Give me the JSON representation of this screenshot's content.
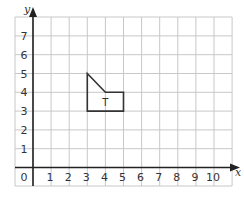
{
  "chart_data": {
    "type": "scatter",
    "title": "",
    "xlabel": "x",
    "ylabel": "y",
    "xlim": [
      0,
      10
    ],
    "ylim": [
      0,
      7
    ],
    "x_ticks": [
      "0",
      "1",
      "2",
      "3",
      "4",
      "5",
      "6",
      "7",
      "8",
      "9",
      "10"
    ],
    "y_ticks": [
      "1",
      "2",
      "3",
      "4",
      "5",
      "6",
      "7"
    ],
    "grid": true,
    "shapes": [
      {
        "label": "T",
        "vertices": [
          [
            3,
            5
          ],
          [
            4,
            4
          ],
          [
            5,
            4
          ],
          [
            5,
            3
          ],
          [
            3,
            3
          ]
        ],
        "label_position": [
          4,
          3.5
        ]
      }
    ]
  },
  "colors": {
    "grid": "#c8c8c8",
    "axis": "#222222",
    "shape": "#333333",
    "text": "#333333"
  }
}
